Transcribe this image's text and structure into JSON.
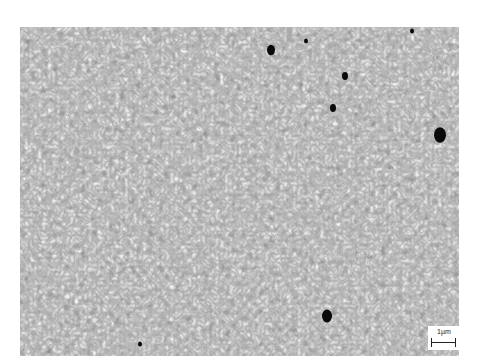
{
  "image": {
    "type": "SEM micrograph",
    "subject": "polycrystalline grain structure",
    "background_color": "#ffffff",
    "grain_base_color": "#a8a8a8",
    "pore_color": "#0a0a0a"
  },
  "scale_bar": {
    "label": "1µm"
  },
  "pores": [
    {
      "x": 271,
      "y": 50,
      "r": 4
    },
    {
      "x": 306,
      "y": 41,
      "r": 2
    },
    {
      "x": 345,
      "y": 76,
      "r": 3
    },
    {
      "x": 333,
      "y": 108,
      "r": 3
    },
    {
      "x": 440,
      "y": 135,
      "r": 6
    },
    {
      "x": 327,
      "y": 316,
      "r": 5
    },
    {
      "x": 140,
      "y": 344,
      "r": 2
    },
    {
      "x": 412,
      "y": 31,
      "r": 2
    }
  ]
}
